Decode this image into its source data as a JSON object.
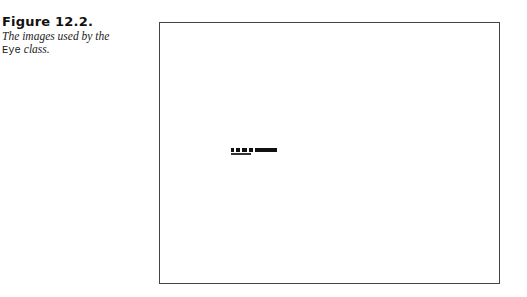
{
  "figure": {
    "number": "Figure 12.2.",
    "caption_part1": "The images used by the",
    "caption_code": "Eye",
    "caption_part2": "class."
  },
  "image_strip": {
    "description": "small row of eye images",
    "segments": [
      {
        "left": 0,
        "width": 3
      },
      {
        "left": 5,
        "width": 4
      },
      {
        "left": 11,
        "width": 5
      },
      {
        "left": 18,
        "width": 4
      },
      {
        "left": 24,
        "width": 22
      }
    ]
  }
}
